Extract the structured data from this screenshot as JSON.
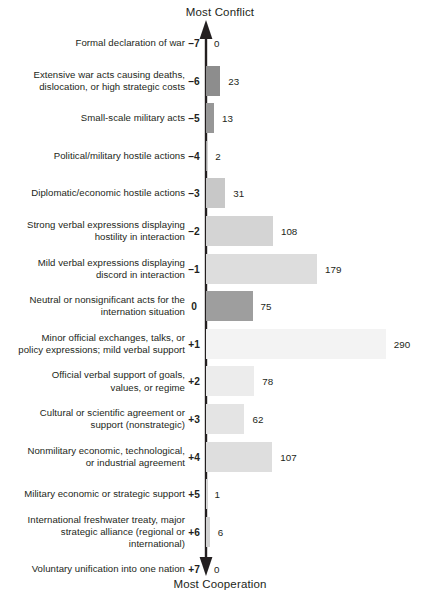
{
  "chart_data": {
    "type": "bar",
    "title": "",
    "orientation": "horizontal",
    "axis_top_label": "Most Conflict",
    "axis_bottom_label": "Most Cooperation",
    "xlabel": "",
    "ylabel": "",
    "xlim": [
      0,
      290
    ],
    "grid": false,
    "legend": "none",
    "categories": [
      "Formal declaration of war",
      "Extensive war acts causing deaths, dislocation, or high strategic costs",
      "Small-scale military acts",
      "Political/military hostile actions",
      "Diplomatic/economic hostile actions",
      "Strong verbal expressions displaying hostility in interaction",
      "Mild verbal expressions displaying discord in interaction",
      "Neutral or nonsignificant acts for the internation situation",
      "Minor official exchanges, talks, or policy expressions; mild verbal support",
      "Official verbal support of goals, values, or regime",
      "Cultural or scientific agreement or support (nonstrategic)",
      "Nonmilitary economic, technological, or industrial agreement",
      "Military economic or strategic support",
      "International freshwater treaty, major strategic alliance (regional or international)",
      "Voluntary unification into one nation"
    ],
    "scale_ticks": [
      "-7",
      "-6",
      "-5",
      "-4",
      "-3",
      "-2",
      "-1",
      "0",
      "+1",
      "+2",
      "+3",
      "+4",
      "+5",
      "+6",
      "+7"
    ],
    "values": [
      0,
      23,
      13,
      2,
      31,
      108,
      179,
      75,
      290,
      78,
      62,
      107,
      1,
      6,
      0
    ]
  },
  "rows": [
    {
      "label_lines": [
        "Formal declaration of war"
      ],
      "scale": "–7",
      "value": 0,
      "value_text": "0",
      "color": "#9a9a9a"
    },
    {
      "label_lines": [
        "Extensive war acts causing deaths,",
        "dislocation, or high strategic costs"
      ],
      "scale": "–6",
      "value": 23,
      "value_text": "23",
      "color": "#8d8d8d"
    },
    {
      "label_lines": [
        "Small-scale military acts"
      ],
      "scale": "–5",
      "value": 13,
      "value_text": "13",
      "color": "#979797"
    },
    {
      "label_lines": [
        "Political/military hostile actions"
      ],
      "scale": "–4",
      "value": 2,
      "value_text": "2",
      "color": "#a5a5a5"
    },
    {
      "label_lines": [
        "Diplomatic/economic hostile actions"
      ],
      "scale": "–3",
      "value": 31,
      "value_text": "31",
      "color": "#c8c8c8"
    },
    {
      "label_lines": [
        "Strong verbal expressions displaying",
        "hostility in interaction"
      ],
      "scale": "–2",
      "value": 108,
      "value_text": "108",
      "color": "#d4d4d4"
    },
    {
      "label_lines": [
        "Mild verbal expressions displaying",
        "discord in interaction"
      ],
      "scale": "–1",
      "value": 179,
      "value_text": "179",
      "color": "#dddddd"
    },
    {
      "label_lines": [
        "Neutral or nonsignificant acts for the",
        "internation situation"
      ],
      "scale": "0",
      "value": 75,
      "value_text": "75",
      "color": "#9e9e9e"
    },
    {
      "label_lines": [
        "Minor official exchanges, talks, or",
        "policy expressions; mild verbal support"
      ],
      "scale": "+1",
      "value": 290,
      "value_text": "290",
      "color": "#f3f3f3"
    },
    {
      "label_lines": [
        "Official verbal support of goals,",
        "values, or regime"
      ],
      "scale": "+2",
      "value": 78,
      "value_text": "78",
      "color": "#ececec"
    },
    {
      "label_lines": [
        "Cultural or scientific agreement or",
        "support (nonstrategic)"
      ],
      "scale": "+3",
      "value": 62,
      "value_text": "62",
      "color": "#e4e4e4"
    },
    {
      "label_lines": [
        "Nonmilitary economic, technological,",
        "or industrial agreement"
      ],
      "scale": "+4",
      "value": 107,
      "value_text": "107",
      "color": "#dedede"
    },
    {
      "label_lines": [
        "Military economic or strategic support"
      ],
      "scale": "+5",
      "value": 1,
      "value_text": "1",
      "color": "#d8d8d8"
    },
    {
      "label_lines": [
        "International freshwater treaty, major",
        "strategic alliance (regional or international)"
      ],
      "scale": "+6",
      "value": 6,
      "value_text": "6",
      "color": "#d2d2d2"
    },
    {
      "label_lines": [
        "Voluntary unification into one nation"
      ],
      "scale": "+7",
      "value": 0,
      "value_text": "0",
      "color": "#cccccc"
    }
  ],
  "layout": {
    "axis_x": 206,
    "first_row_center": 43,
    "row_step": 37.6,
    "px_per_unit": 0.6201,
    "bar_height": 30,
    "value_gap": 8,
    "axis_color": "#231f20"
  }
}
